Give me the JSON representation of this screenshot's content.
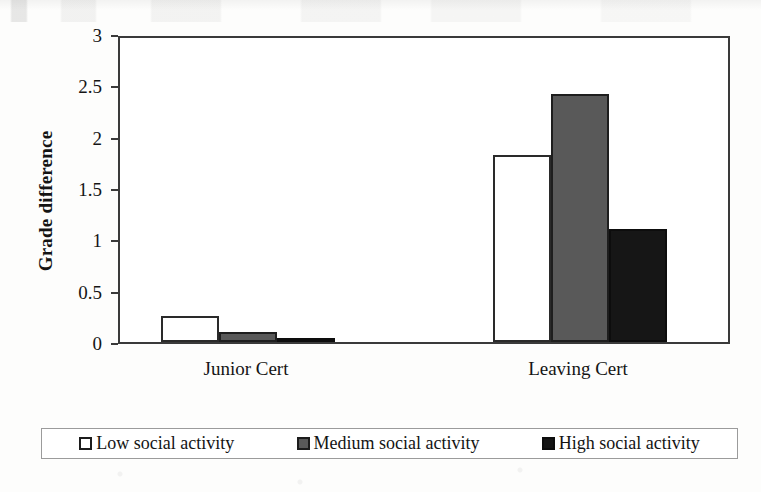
{
  "chart_data": {
    "type": "bar",
    "title": "",
    "xlabel": "",
    "ylabel": "Grade difference",
    "categories": [
      "Junior Cert",
      "Leaving Cert"
    ],
    "series": [
      {
        "name": "Low social activity",
        "color": "#ffffff",
        "values": [
          0.25,
          1.82
        ]
      },
      {
        "name": "Medium social activity",
        "color": "#595959",
        "values": [
          0.1,
          2.42
        ]
      },
      {
        "name": "High social activity",
        "color": "#161616",
        "values": [
          0.02,
          1.1
        ]
      }
    ],
    "ylim": [
      0,
      3
    ],
    "yticks": [
      "0",
      "0.5",
      "1",
      "1.5",
      "2",
      "2.5",
      "3"
    ],
    "ytick_values": [
      0,
      0.5,
      1,
      1.5,
      2,
      2.5,
      3
    ],
    "grid": false,
    "legend_position": "bottom",
    "frame": true
  },
  "axis": {
    "y_title": "Grade difference"
  },
  "legend": {
    "entries": [
      {
        "label": "Low social activity",
        "swatch": "low-swatch"
      },
      {
        "label": "Medium social activity",
        "swatch": "medium-swatch"
      },
      {
        "label": "High social activity",
        "swatch": "high-swatch"
      }
    ]
  }
}
